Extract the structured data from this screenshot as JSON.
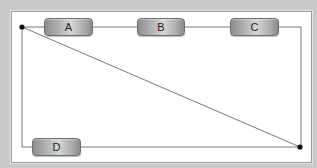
{
  "diagram": {
    "nodes": [
      {
        "id": "A",
        "label": "A"
      },
      {
        "id": "B",
        "label": "B"
      },
      {
        "id": "C",
        "label": "C"
      },
      {
        "id": "D",
        "label": "D"
      }
    ],
    "junctions": [
      {
        "id": "top-left",
        "x": 22,
        "y": 27
      },
      {
        "id": "bottom-right",
        "x": 300,
        "y": 147
      }
    ],
    "edges": [
      {
        "from": "top-left",
        "to": "A"
      },
      {
        "from": "A",
        "to": "B"
      },
      {
        "from": "B",
        "to": "C"
      },
      {
        "from": "C",
        "to": "bottom-right"
      },
      {
        "from": "top-left",
        "to": "D"
      },
      {
        "from": "D",
        "to": "bottom-right"
      },
      {
        "from": "top-left",
        "to": "bottom-right"
      }
    ],
    "colors": {
      "background": "#c9c9c9",
      "panel": "#ffffff",
      "wire": "#7a7a7a",
      "junction": "#111111"
    }
  }
}
